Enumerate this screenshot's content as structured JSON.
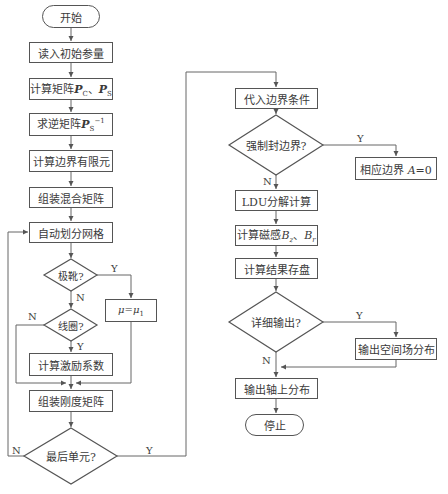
{
  "flowchart": {
    "left_column": {
      "start": "开始",
      "read_params": "读入初始参量",
      "calc_matrix_prefix": "计算矩阵",
      "calc_matrix_p": "P",
      "calc_matrix_sub1": "C",
      "calc_matrix_sep": "、",
      "calc_matrix_sub2": "S",
      "inverse_prefix": "求逆矩阵",
      "inverse_p": "P",
      "inverse_sub": "S",
      "inverse_sup": "−1",
      "calc_boundary_fem": "计算边界有限元",
      "assemble_mixed": "组装混合矩阵",
      "auto_mesh": "自动划分网格",
      "decision_pole_shoe": "极靴?",
      "mu_assign_mu": "μ",
      "mu_assign_eq": "=",
      "mu_assign_sub": "1",
      "decision_coil": "线圈?",
      "calc_excitation": "计算激励系数",
      "assemble_stiffness": "组装刚度矩阵",
      "decision_last_element": "最后单元?"
    },
    "right_column": {
      "apply_boundary": "代入边界条件",
      "decision_forced_boundary": "强制封边界?",
      "set_boundary_text": "相应边界 ",
      "set_boundary_var": "A",
      "set_boundary_val": "=0",
      "ldu": "LDU分解计算",
      "calc_flux_prefix": "计算磁感",
      "calc_flux_b": "B",
      "calc_flux_sub1": "z",
      "calc_flux_sep": "、",
      "calc_flux_sub2": "r",
      "save_results": "计算结果存盘",
      "decision_detail_output": "详细输出?",
      "output_spatial": "输出空间场分布",
      "output_axial": "输出轴上分布",
      "stop": "停止"
    },
    "branch_labels": {
      "yes": "Y",
      "no": "N"
    }
  }
}
